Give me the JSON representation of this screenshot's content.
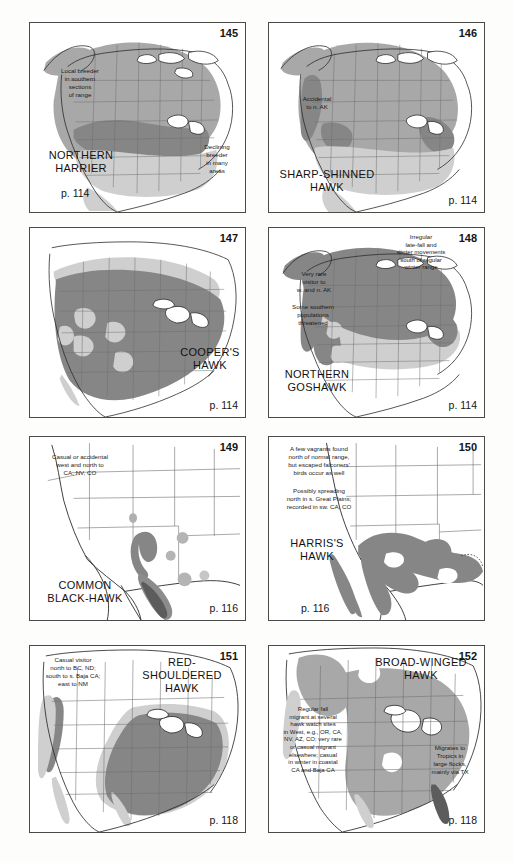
{
  "page": {
    "background_color": "#fdfdfc",
    "panel_border_color": "#4a4a4a",
    "shade_light": "#cfcfcf",
    "shade_medium": "#a8a8a8",
    "shade_dark": "#868686",
    "coast_line_color": "#2a2a2a",
    "state_line_color": "#6f6f6f"
  },
  "panels": [
    {
      "plate": "145",
      "species": "NORTHERN\nHARRIER",
      "page_ref": "p. 114",
      "notes": [
        "Local breeder\nin southern\nsections\nof range",
        "Declining\nbreeder\nin many\nareas"
      ],
      "map_extent": "north-america"
    },
    {
      "plate": "146",
      "species": "SHARP-SHINNED\nHAWK",
      "page_ref": "p. 114",
      "notes": [
        "Accidental\nto n. AK"
      ],
      "map_extent": "north-america"
    },
    {
      "plate": "147",
      "species": "COOPER'S\nHAWK",
      "page_ref": "p. 114",
      "notes": [],
      "map_extent": "usa-southern-canada"
    },
    {
      "plate": "148",
      "species": "NORTHERN\nGOSHAWK",
      "page_ref": "p. 114",
      "notes": [
        "Irregular\nlate-fall and\nwinter movements\nsouth of regular\nwinter range",
        "Very rare\nvisitor to\nw. and n. AK",
        "Some southern\npopulations\nthreatened"
      ],
      "map_extent": "north-america"
    },
    {
      "plate": "149",
      "species": "COMMON\nBLACK-HAWK",
      "page_ref": "p. 116",
      "notes": [
        "Casual or accidental\nwest and north to\nCA, NV, CO"
      ],
      "map_extent": "southwest"
    },
    {
      "plate": "150",
      "species": "HARRIS'S\nHAWK",
      "page_ref": "p. 116",
      "notes": [
        "A few vagrants found\nnorth of normal range,\nbut escaped falconers'\nbirds occur as well",
        "Possibly spreading\nnorth in s. Great Plains;\nrecorded in sw. CA, CO"
      ],
      "map_extent": "southwest"
    },
    {
      "plate": "151",
      "species": "RED-SHOULDERED\nHAWK",
      "page_ref": "p. 118",
      "notes": [
        "Casual visitor\nnorth to BC, ND;\nsouth to s. Baja CA;\neast to NM"
      ],
      "map_extent": "usa-east"
    },
    {
      "plate": "152",
      "species": "BROAD-WINGED\nHAWK",
      "page_ref": "p. 118",
      "notes": [
        "Regular fall\nmigrant at several\nhawk watch sites\nin West, e.g., OR, CA,\nNV, AZ, CO; very rare\nor casual migrant\nelsewhere; casual\nin winter in coastal\nCA and Baja CA",
        "Migrates to\nTropics in\nlarge flocks,\nmainly via TX"
      ],
      "map_extent": "usa-east"
    }
  ]
}
